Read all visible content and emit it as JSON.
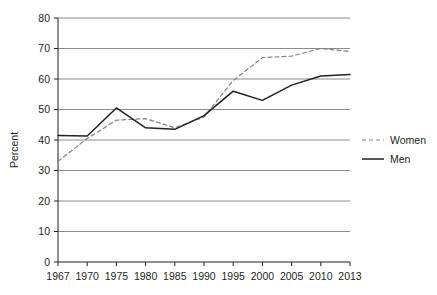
{
  "chart_data": {
    "type": "line",
    "title": "",
    "subtitle": "",
    "xlabel": "",
    "ylabel": "Percent",
    "x": [
      1967,
      1970,
      1975,
      1980,
      1985,
      1990,
      1995,
      2000,
      2005,
      2010,
      2013
    ],
    "xtick_labels": [
      "1967",
      "1970",
      "1975",
      "1980",
      "1985",
      "1990",
      "1995",
      "2000",
      "2005",
      "2010",
      "2013"
    ],
    "ytick_labels": [
      "0",
      "10",
      "20",
      "30",
      "40",
      "50",
      "60",
      "70",
      "80"
    ],
    "yticks": [
      0,
      10,
      20,
      30,
      40,
      50,
      60,
      70,
      80
    ],
    "ylim": [
      0,
      80
    ],
    "grid": "horizontal",
    "legend_position": "right",
    "series": [
      {
        "name": "Women",
        "style": "dashed",
        "color": "#808080",
        "values": [
          33.0,
          40.5,
          46.5,
          47.0,
          44.0,
          47.5,
          59.5,
          67.0,
          67.5,
          70.0,
          69.0
        ]
      },
      {
        "name": "Men",
        "style": "solid",
        "color": "#231f20",
        "values": [
          41.5,
          41.3,
          50.5,
          44.0,
          43.5,
          48.0,
          56.0,
          53.0,
          58.0,
          61.0,
          61.5
        ]
      }
    ]
  },
  "legend": {
    "items": [
      {
        "label": "Women"
      },
      {
        "label": "Men"
      }
    ]
  },
  "axis": {
    "y_title": "Percent"
  }
}
